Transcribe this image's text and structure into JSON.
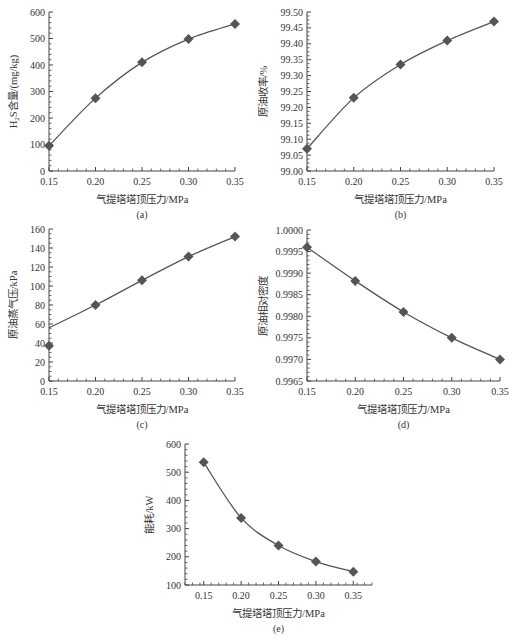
{
  "colors": {
    "line": "#555555",
    "marker": "#555555",
    "axis": "#444444",
    "text": "#333333"
  },
  "chart_data": [
    {
      "id": "a",
      "type": "line",
      "panel_label": "(a)",
      "title": "",
      "xlabel": "气提塔塔顶压力/MPa",
      "ylabel": "H2S含量/(mg/kg)",
      "x": [
        0.15,
        0.2,
        0.25,
        0.3,
        0.35
      ],
      "series": [
        {
          "name": "H2S含量",
          "values": [
            95,
            275,
            410,
            498,
            555
          ]
        }
      ],
      "xlim": [
        0.15,
        0.35
      ],
      "ylim": [
        0,
        600
      ],
      "xticks": [
        "0.15",
        "0.20",
        "0.25",
        "0.30",
        "0.35"
      ],
      "yticks": [
        "0",
        "100",
        "200",
        "300",
        "400",
        "500",
        "600"
      ],
      "grid": false,
      "marker": "diamond",
      "box": {
        "left": 49,
        "top": 12,
        "right": 235,
        "bottom": 171
      }
    },
    {
      "id": "b",
      "type": "line",
      "panel_label": "(b)",
      "title": "",
      "xlabel": "气提塔塔顶压力/MPa",
      "ylabel": "原油收率/%",
      "x": [
        0.15,
        0.2,
        0.25,
        0.3,
        0.35
      ],
      "series": [
        {
          "name": "原油收率",
          "values": [
            99.07,
            99.23,
            99.335,
            99.41,
            99.47
          ]
        }
      ],
      "xlim": [
        0.15,
        0.35
      ],
      "ylim": [
        99.0,
        99.5
      ],
      "xticks": [
        "0.15",
        "0.20",
        "0.25",
        "0.30",
        "0.35"
      ],
      "yticks": [
        "99.00",
        "99.05",
        "99.10",
        "99.15",
        "99.20",
        "99.25",
        "99.30",
        "99.35",
        "99.40",
        "99.45",
        "99.50"
      ],
      "grid": false,
      "marker": "diamond",
      "box": {
        "left": 307,
        "top": 12,
        "right": 494,
        "bottom": 171
      }
    },
    {
      "id": "c",
      "type": "line",
      "panel_label": "(c)",
      "title": "",
      "xlabel": "气提塔塔顶压力/MPa",
      "ylabel": "原油蒸气压/kPa",
      "x": [
        0.15,
        0.2,
        0.25,
        0.3,
        0.35
      ],
      "series": [
        {
          "name": "原油蒸气压",
          "values": [
            37,
            80,
            106,
            131,
            152
          ]
        }
      ],
      "line_start_value": 56,
      "xlim": [
        0.15,
        0.35
      ],
      "ylim": [
        0,
        160
      ],
      "xticks": [
        "0.15",
        "0.20",
        "0.25",
        "0.30",
        "0.35"
      ],
      "yticks": [
        "0",
        "20",
        "40",
        "60",
        "80",
        "100",
        "120",
        "140",
        "160"
      ],
      "grid": false,
      "marker": "diamond",
      "box": {
        "left": 49,
        "top": 229,
        "right": 235,
        "bottom": 381
      }
    },
    {
      "id": "d",
      "type": "line",
      "panel_label": "(d)",
      "title": "",
      "xlabel": "气提塔塔顶压力/MPa",
      "ylabel": "原油相对密度",
      "x": [
        0.15,
        0.2,
        0.25,
        0.3,
        0.35
      ],
      "series": [
        {
          "name": "原油相对密度",
          "values": [
            0.9996,
            0.99882,
            0.9981,
            0.9975,
            0.997
          ]
        }
      ],
      "xlim": [
        0.15,
        0.35
      ],
      "ylim": [
        0.9965,
        1.0
      ],
      "xticks": [
        "0.15",
        "0.20",
        "0.25",
        "0.30",
        "0.35"
      ],
      "yticks": [
        "0.9965",
        "0.9970",
        "0.9975",
        "0.9980",
        "0.9985",
        "0.9990",
        "0.9995",
        "1.0000"
      ],
      "grid": false,
      "marker": "diamond",
      "box": {
        "left": 307,
        "top": 230,
        "right": 500,
        "bottom": 381
      }
    },
    {
      "id": "e",
      "type": "line",
      "panel_label": "(e)",
      "title": "",
      "xlabel": "气提塔塔顶压力/MPa",
      "ylabel": "能耗/kW",
      "x": [
        0.15,
        0.2,
        0.25,
        0.3,
        0.35
      ],
      "series": [
        {
          "name": "能耗",
          "values": [
            535,
            338,
            240,
            183,
            147
          ]
        }
      ],
      "xlim": [
        0.125,
        0.375
      ],
      "ylim": [
        100,
        600
      ],
      "xticks": [
        "0.15",
        "0.20",
        "0.25",
        "0.30",
        "0.35"
      ],
      "yticks": [
        "100",
        "200",
        "300",
        "400",
        "500",
        "600"
      ],
      "grid": false,
      "marker": "diamond",
      "box": {
        "left": 185,
        "top": 444,
        "right": 372,
        "bottom": 585
      }
    }
  ]
}
